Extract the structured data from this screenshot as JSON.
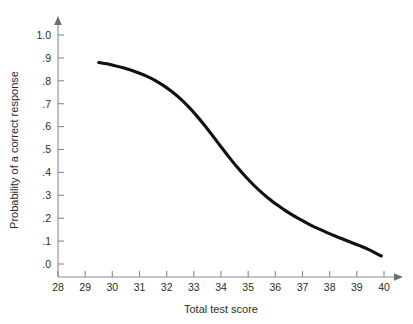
{
  "chart_data": {
    "type": "line",
    "title": "",
    "subtitle": "",
    "xlabel": "Total test score",
    "ylabel": "Probability of a correct response",
    "xlim": [
      28,
      40
    ],
    "ylim": [
      0.0,
      1.0
    ],
    "grid": false,
    "legend": null,
    "legend_position": "none",
    "x_ticks": [
      28,
      29,
      30,
      31,
      32,
      33,
      34,
      35,
      36,
      37,
      38,
      39,
      40
    ],
    "x_tick_labels": [
      "28",
      "29",
      "30",
      "31",
      "32",
      "33",
      "34",
      "35",
      "36",
      "37",
      "38",
      "39",
      "40"
    ],
    "y_ticks": [
      0.0,
      0.1,
      0.2,
      0.3,
      0.4,
      0.5,
      0.6,
      0.7,
      0.8,
      0.9,
      1.0
    ],
    "y_tick_labels": [
      ".0",
      ".1",
      ".2",
      ".3",
      ".4",
      ".5",
      ".6",
      ".7",
      ".8",
      ".9",
      "1.0"
    ],
    "series": [
      {
        "name": "item characteristic curve",
        "color": "#111111",
        "line_width": 3.1,
        "x": [
          29.5,
          29.8,
          30.1,
          30.4,
          30.7,
          31.0,
          31.3,
          31.6,
          31.9,
          32.2,
          32.5,
          32.8,
          33.1,
          33.4,
          33.7,
          34.0,
          34.3,
          34.6,
          34.9,
          35.2,
          35.5,
          35.8,
          36.1,
          36.4,
          36.7,
          37.0,
          37.3,
          37.6,
          37.9,
          38.2,
          38.5,
          38.8,
          39.1,
          39.4,
          39.9
        ],
        "y": [
          0.88,
          0.874,
          0.866,
          0.857,
          0.846,
          0.833,
          0.818,
          0.8,
          0.778,
          0.752,
          0.722,
          0.687,
          0.648,
          0.605,
          0.559,
          0.512,
          0.466,
          0.422,
          0.382,
          0.345,
          0.312,
          0.282,
          0.255,
          0.231,
          0.209,
          0.189,
          0.17,
          0.153,
          0.137,
          0.122,
          0.108,
          0.094,
          0.08,
          0.065,
          0.035
        ]
      }
    ],
    "annotations": []
  },
  "axes": {
    "x_axis_name": "Total test score",
    "y_axis_name": "Probability of a correct response"
  },
  "colors": {
    "curve": "#111111",
    "axis": "#8a8a8a",
    "text": "#2b2b2b",
    "background": "#ffffff"
  }
}
